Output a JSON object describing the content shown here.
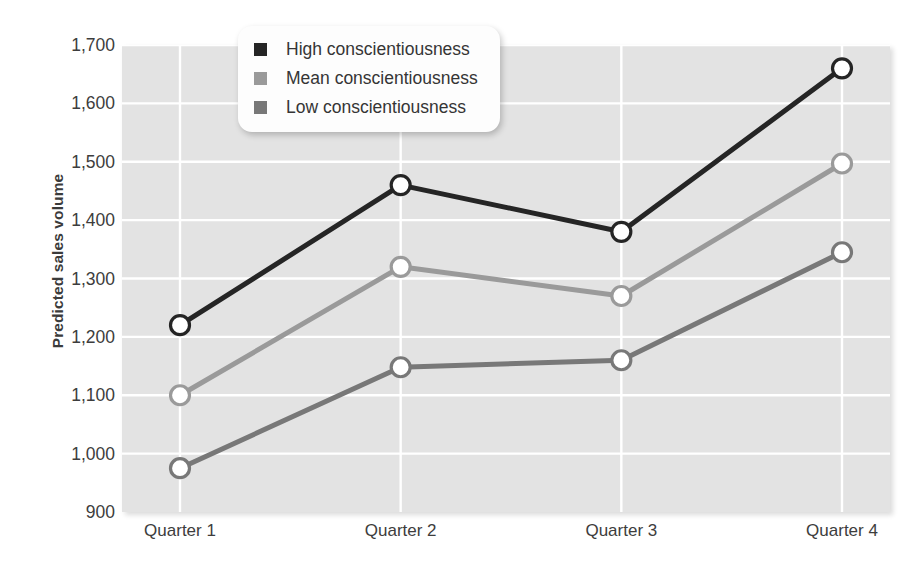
{
  "chart_data": {
    "type": "line",
    "title": "",
    "xlabel": "",
    "ylabel": "Predicted sales volume",
    "categories": [
      "Quarter 1",
      "Quarter 2",
      "Quarter 3",
      "Quarter 4"
    ],
    "ylim": [
      900,
      1700
    ],
    "ytick_labels": [
      "1,700",
      "1,600",
      "1,500",
      "1,400",
      "1,300",
      "1,200",
      "1,100",
      "1,000",
      "900"
    ],
    "ytick_values": [
      1700,
      1600,
      1500,
      1400,
      1300,
      1200,
      1100,
      1000,
      900
    ],
    "grid": true,
    "legend_position": "top-center",
    "series": [
      {
        "name": "High conscientiousness",
        "color": "#252525",
        "values": [
          1220,
          1460,
          1380,
          1660
        ]
      },
      {
        "name": "Mean conscientiousness",
        "color": "#9a9a9a",
        "values": [
          1100,
          1320,
          1270,
          1497
        ]
      },
      {
        "name": "Low conscientiousness",
        "color": "#787878",
        "values": [
          975,
          1148,
          1160,
          1345
        ]
      }
    ]
  },
  "legend": {
    "items": [
      {
        "label": "High conscientiousness",
        "swatch": "legend-swatch-high"
      },
      {
        "label": "Mean conscientiousness",
        "swatch": "legend-swatch-mean"
      },
      {
        "label": "Low conscientiousness",
        "swatch": "legend-swatch-low"
      }
    ]
  },
  "colors": {
    "plot_background": "#e3e3e3",
    "gridline": "#ffffff",
    "page_background": "#ffffff",
    "text": "#3d3d3d",
    "marker_fill": "#ffffff"
  }
}
